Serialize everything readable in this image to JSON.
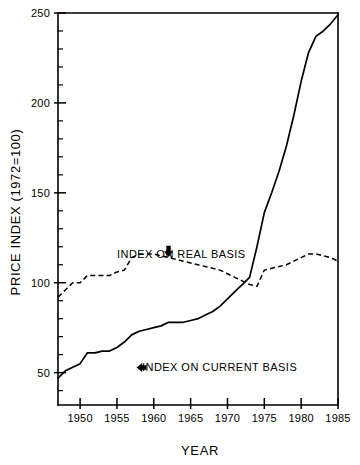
{
  "chart_data": {
    "type": "line",
    "title": "",
    "xlabel": "YEAR",
    "ylabel": "PRICE INDEX (1972=100)",
    "xlim": [
      1947,
      1985
    ],
    "ylim": [
      32,
      250
    ],
    "grid": false,
    "legend_position": "inline-annotations",
    "x_ticks": [
      1950,
      1955,
      1960,
      1965,
      1970,
      1975,
      1980,
      1985
    ],
    "x_tick_labels": [
      "1950",
      "1955",
      "1960",
      "1965",
      "1970",
      "1975",
      "1980",
      "1985"
    ],
    "x_minor_tick_interval": 5,
    "y_ticks": [
      50,
      100,
      150,
      200,
      250
    ],
    "y_tick_labels": [
      "50",
      "100",
      "150",
      "200",
      "250"
    ],
    "y_minor_tick_interval": 10,
    "x": [
      1947,
      1948,
      1949,
      1950,
      1951,
      1952,
      1953,
      1954,
      1955,
      1956,
      1957,
      1958,
      1959,
      1960,
      1961,
      1962,
      1963,
      1964,
      1965,
      1966,
      1967,
      1968,
      1969,
      1970,
      1971,
      1972,
      1973,
      1974,
      1975,
      1976,
      1977,
      1978,
      1979,
      1980,
      1981,
      1982,
      1983,
      1984,
      1985
    ],
    "series": [
      {
        "name": "INDEX ON CURRENT BASIS",
        "style": "solid",
        "color": "#000000",
        "values": [
          47,
          51,
          53,
          55,
          61,
          61,
          62,
          62,
          64,
          67,
          71,
          73,
          74,
          75,
          76,
          78,
          78,
          78,
          79,
          80,
          82,
          84,
          87,
          91,
          95,
          99,
          103,
          120,
          139,
          150,
          162,
          176,
          193,
          212,
          228,
          237,
          240,
          244,
          249
        ]
      },
      {
        "name": "INDEX ON REAL BASIS",
        "style": "dashed",
        "color": "#000000",
        "values": [
          92,
          96,
          100,
          100,
          104,
          104,
          104,
          104,
          106,
          107,
          114,
          116,
          116,
          116,
          115,
          114,
          113,
          112,
          111,
          110,
          109,
          108,
          107,
          105,
          103,
          101,
          99,
          98,
          107,
          108,
          109,
          110,
          112,
          114,
          116,
          116,
          115,
          114,
          112
        ]
      }
    ],
    "annotations": [
      {
        "name": "real-basis-label",
        "text": "INDEX ON REAL BASIS",
        "arrow": "down",
        "points_to_year": 1962,
        "points_to_value": 115
      },
      {
        "name": "current-basis-label",
        "text": "INDEX ON CURRENT BASIS",
        "arrow": "left",
        "points_to_year": 1957,
        "points_to_value": 69
      }
    ]
  }
}
